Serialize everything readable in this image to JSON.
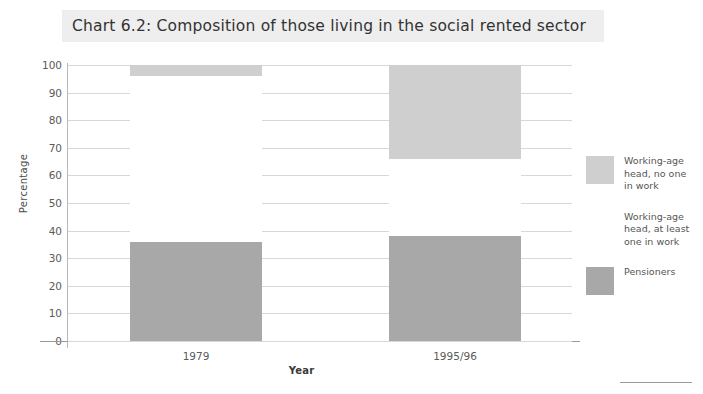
{
  "chart_data": {
    "type": "bar",
    "title": "Chart 6.2: Composition of those living in the social rented sector",
    "xlabel": "Year",
    "ylabel": "Percentage",
    "categories": [
      "1979",
      "1995/96"
    ],
    "ylim": [
      0,
      100
    ],
    "yticks": [
      "100",
      "90",
      "80",
      "70",
      "60",
      "50",
      "40",
      "30",
      "20",
      "10",
      "0"
    ],
    "grid": true,
    "stacked": true,
    "legend_position": "right",
    "series": [
      {
        "name": "Working-age\nhead, no one\nin work",
        "color": "#cfcfcf",
        "values": [
          4,
          34
        ]
      },
      {
        "name": "Working-age\nhead, at least\none in work",
        "color": "#ffffff",
        "values": [
          60,
          28
        ]
      },
      {
        "name": "Pensioners",
        "color": "#a8a8a8",
        "values": [
          36,
          38
        ]
      }
    ]
  },
  "legend": {
    "items": [
      {
        "label": "Working-age\nhead, no one\nin work",
        "color": "#cfcfcf"
      },
      {
        "label": "Working-age\nhead, at least\none in work",
        "color": "#ffffff"
      },
      {
        "label": "Pensioners",
        "color": "#a8a8a8"
      }
    ]
  }
}
